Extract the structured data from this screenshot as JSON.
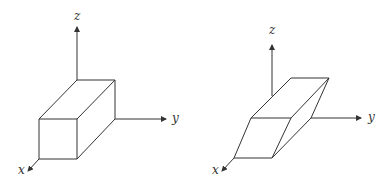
{
  "figures": [
    {
      "name": "rectangular-box",
      "axes": {
        "x": "x",
        "y": "y",
        "z": "z"
      }
    },
    {
      "name": "sheared-parallelepiped",
      "axes": {
        "x": "x",
        "y": "y",
        "z": "z"
      }
    }
  ],
  "colors": {
    "line": "#333333",
    "background": "#ffffff"
  }
}
